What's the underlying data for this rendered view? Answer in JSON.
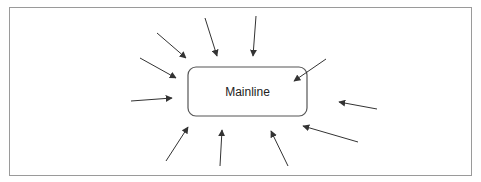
{
  "diagram": {
    "center_node": {
      "label": "Mainline"
    },
    "incoming_arrow_count": 11,
    "colors": {
      "frame": "#9a9a9a",
      "node_border": "#555555",
      "arrow": "#333333",
      "text": "#222222"
    }
  }
}
